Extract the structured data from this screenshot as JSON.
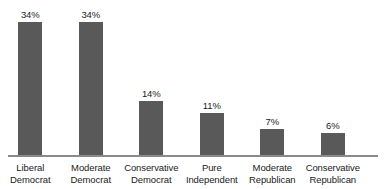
{
  "chart_data": {
    "type": "bar",
    "title": "",
    "subtitle": "",
    "xlabel": "",
    "ylabel": "",
    "ylim": [
      0,
      40
    ],
    "grid": false,
    "legend": false,
    "orientation": "vertical",
    "categories": [
      "Liberal Democrat",
      "Moderate Democrat",
      "Conservative Democrat",
      "Pure Independent",
      "Moderate Republican",
      "Conservative Republican"
    ],
    "category_lines": [
      [
        "Liberal",
        "Democrat"
      ],
      [
        "Moderate",
        "Democrat"
      ],
      [
        "Conservative",
        "Democrat"
      ],
      [
        "Pure",
        "Independent"
      ],
      [
        "Moderate",
        "Republican"
      ],
      [
        "Conservative",
        "Republican"
      ]
    ],
    "values": [
      34,
      34,
      14,
      11,
      7,
      6
    ],
    "data_labels": [
      "34%",
      "34%",
      "14%",
      "11%",
      "7%",
      "6%"
    ],
    "units": "percent"
  },
  "style": {
    "bar_color": "#595959",
    "axis_color": "#8a8a8a",
    "text_color": "#1b1b1b",
    "background_color": "#ffffff"
  },
  "bars": [
    {
      "label": "34%",
      "category_line1": "Liberal",
      "category_line2": "Democrat"
    },
    {
      "label": "34%",
      "category_line1": "Moderate",
      "category_line2": "Democrat"
    },
    {
      "label": "14%",
      "category_line1": "Conservative",
      "category_line2": "Democrat"
    },
    {
      "label": "11%",
      "category_line1": "Pure",
      "category_line2": "Independent"
    },
    {
      "label": "7%",
      "category_line1": "Moderate",
      "category_line2": "Republican"
    },
    {
      "label": "6%",
      "category_line1": "Conservative",
      "category_line2": "Republican"
    }
  ]
}
